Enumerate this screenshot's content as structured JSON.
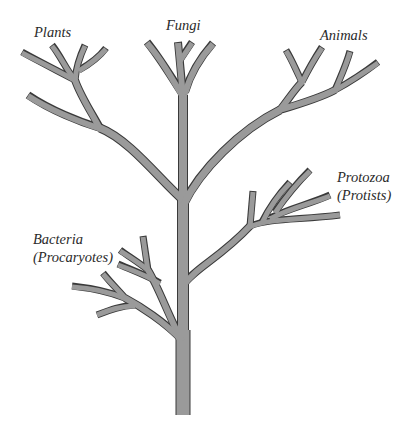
{
  "diagram": {
    "type": "phylogenetic-tree",
    "colors": {
      "branch_fill": "#9a9a9a",
      "branch_outline": "#3a3a3a",
      "background": "#ffffff",
      "label_text": "#2a2a2a"
    },
    "labels": {
      "plants": "Plants",
      "fungi": "Fungi",
      "animals": "Animals",
      "protozoa_line1": "Protozoa",
      "protozoa_line2": "(Protists)",
      "bacteria_line1": "Bacteria",
      "bacteria_line2": "(Procaryotes)"
    },
    "groups": [
      {
        "name": "Plants",
        "tips": 5
      },
      {
        "name": "Fungi",
        "tips": 3
      },
      {
        "name": "Animals",
        "tips": 4
      },
      {
        "name": "Protozoa (Protists)",
        "tips": 4
      },
      {
        "name": "Bacteria (Procaryotes)",
        "tips": 5
      }
    ]
  }
}
